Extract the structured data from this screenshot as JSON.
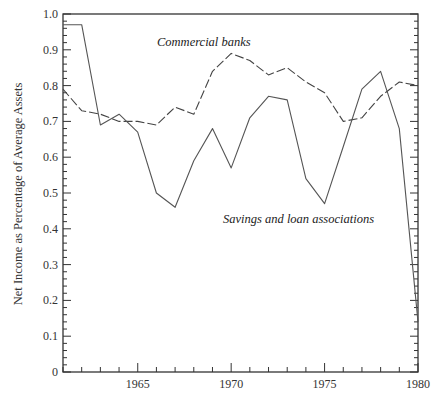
{
  "chart_data": {
    "type": "line",
    "title": "",
    "xlabel": "",
    "ylabel": "Net Income as Percentage of Average Assets",
    "xlim": [
      1961,
      1980
    ],
    "ylim": [
      0,
      1.0
    ],
    "x": [
      1961,
      1962,
      1963,
      1964,
      1965,
      1966,
      1967,
      1968,
      1969,
      1970,
      1971,
      1972,
      1973,
      1974,
      1975,
      1976,
      1977,
      1978,
      1979,
      1980
    ],
    "x_ticks": [
      1965,
      1970,
      1975,
      1980
    ],
    "x_tick_labels": [
      "1965",
      "1970",
      "1975",
      "1980"
    ],
    "y_ticks": [
      0,
      0.1,
      0.2,
      0.3,
      0.4,
      0.5,
      0.6,
      0.7,
      0.8,
      0.9,
      1.0
    ],
    "y_tick_labels": [
      "0",
      "0.1",
      "0.2",
      "0.3",
      "0.4",
      "0.5",
      "0.6",
      "0.7",
      "0.8",
      "0.9",
      "1.0"
    ],
    "grid": false,
    "series": [
      {
        "name": "Commercial banks",
        "style": "dashed",
        "color": "#444444",
        "values": [
          0.79,
          0.73,
          0.72,
          0.7,
          0.7,
          0.69,
          0.74,
          0.72,
          0.84,
          0.89,
          0.87,
          0.83,
          0.85,
          0.81,
          0.78,
          0.7,
          0.71,
          0.77,
          0.81,
          0.8
        ]
      },
      {
        "name": "Savings and loan associations",
        "style": "solid",
        "color": "#555555",
        "values": [
          0.97,
          0.97,
          0.69,
          0.72,
          0.67,
          0.5,
          0.46,
          0.59,
          0.68,
          0.57,
          0.71,
          0.77,
          0.76,
          0.54,
          0.47,
          0.63,
          0.79,
          0.84,
          0.68,
          0.14
        ]
      }
    ],
    "annotations": [
      {
        "text": "Commercial banks",
        "series": "Commercial banks",
        "placement": "above line, left-center"
      },
      {
        "text": "Savings and loan associations",
        "series": "Savings and loan associations",
        "placement": "below line, center-right"
      }
    ]
  }
}
